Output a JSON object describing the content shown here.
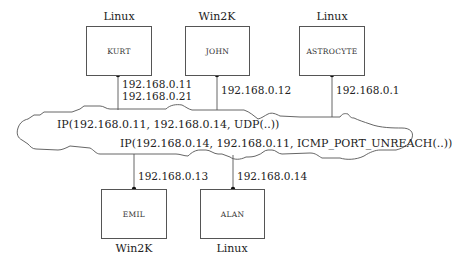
{
  "hosts": [
    {
      "name": "KURT",
      "os": "Linux",
      "ips": [
        "192.168.0.11",
        "192.168.0.21"
      ]
    },
    {
      "name": "JOHN",
      "os": "Win2K",
      "ips": [
        "192.168.0.12"
      ]
    },
    {
      "name": "ASTROCYTE",
      "os": "Linux",
      "ips": [
        "192.168.0.1"
      ]
    },
    {
      "name": "EMIL",
      "os": "Win2K",
      "ips": [
        "192.168.0.13"
      ]
    },
    {
      "name": "ALAN",
      "os": "Linux",
      "ips": [
        "192.168.0.14"
      ]
    }
  ],
  "network": {
    "packets": [
      "IP(192.168.0.11, 192.168.0.14, UDP(..))",
      "IP(192.168.0.14, 192.168.0.11, ICMP_PORT_UNREACH(..))"
    ]
  }
}
